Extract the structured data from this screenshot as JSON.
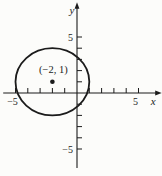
{
  "figure": {
    "background": "#fcfcfa",
    "ink_color": "#1b1b1b"
  },
  "chart_data": {
    "type": "scatter",
    "title": "",
    "xlabel": "x",
    "ylabel": "y",
    "xlim": [
      -6,
      6.6
    ],
    "ylim": [
      -6.7,
      7.8
    ],
    "grid": false,
    "x_ticks": [
      -5,
      -4,
      -3,
      -2,
      -1,
      1,
      2,
      3,
      4,
      5
    ],
    "y_ticks": [
      -5,
      -4,
      -3,
      -2,
      -1,
      1,
      2,
      3,
      4,
      5
    ],
    "x_tick_labels": [
      {
        "value": -5,
        "label": "−5"
      },
      {
        "value": 5,
        "label": "5"
      }
    ],
    "y_tick_labels": [
      {
        "value": -5,
        "label": "−5"
      },
      {
        "value": 5,
        "label": "5"
      }
    ],
    "shapes": [
      {
        "kind": "circle",
        "center": [
          -2,
          1
        ],
        "radius": 3
      }
    ],
    "points": [
      {
        "x": -2,
        "y": 1,
        "label": "(−2, 1)",
        "marker": "filled-dot"
      }
    ]
  }
}
